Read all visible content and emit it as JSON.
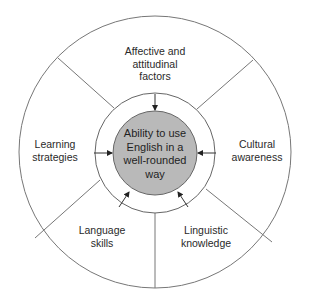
{
  "center": {
    "lines": [
      "Ability to use",
      "English in a",
      "well-rounded",
      "way"
    ],
    "fill": "#b9b9b9"
  },
  "segments": [
    {
      "id": "affective",
      "lines": [
        "Affective and",
        "attitudinal",
        "factors"
      ]
    },
    {
      "id": "cultural",
      "lines": [
        "Cultural",
        "awareness"
      ]
    },
    {
      "id": "linguistic",
      "lines": [
        "Linguistic",
        "knowledge"
      ]
    },
    {
      "id": "language-skills",
      "lines": [
        "Language",
        "skills"
      ]
    },
    {
      "id": "learning",
      "lines": [
        "Learning",
        "strategies"
      ]
    }
  ],
  "colors": {
    "stroke": "#6e6e6e",
    "text": "#2a2a2a",
    "background": "#ffffff"
  }
}
